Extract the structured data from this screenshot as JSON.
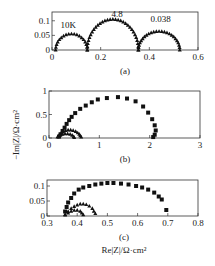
{
  "chart_data": [
    {
      "id": "a",
      "type": "scatter",
      "panel_label": "(a)",
      "xlim": [
        0,
        0.6
      ],
      "ylim": [
        0,
        0.13
      ],
      "xticks": [
        0,
        0.2,
        0.4,
        0.6
      ],
      "xtick_labels": [
        "0",
        "0.2",
        "0.4",
        "0.6"
      ],
      "yticks": [
        0,
        0.05,
        0.1
      ],
      "ytick_labels": [
        "0",
        "0.05",
        "0.1"
      ],
      "frame": {
        "x": 52,
        "y": 12,
        "w": 146,
        "h": 38
      },
      "annotations": [
        {
          "text": "10K",
          "x": 0.035,
          "y": 0.075
        },
        {
          "text": "4.8",
          "x": 0.245,
          "y": 0.113
        },
        {
          "text": "0.038",
          "x": 0.405,
          "y": 0.095
        }
      ],
      "series": [
        {
          "name": "arc1",
          "marker": "triangle",
          "center": 0.08,
          "radius": 0.065,
          "ycenter": 0.0,
          "yscale": 0.85,
          "n": 18
        },
        {
          "name": "arc2",
          "marker": "triangle",
          "center": 0.25,
          "radius": 0.105,
          "ycenter": 0.0,
          "yscale": 1.0,
          "n": 30
        },
        {
          "name": "arc3",
          "marker": "triangle",
          "center": 0.44,
          "radius": 0.085,
          "ycenter": 0.0,
          "yscale": 0.75,
          "n": 24
        }
      ]
    },
    {
      "id": "b",
      "type": "scatter",
      "panel_label": "(b)",
      "ylabel": "−Im|Z|/Ω·cm²",
      "xlim": [
        0,
        3
      ],
      "ylim": [
        0,
        1
      ],
      "xticks": [
        0,
        1,
        2,
        3
      ],
      "xtick_labels": [
        "0",
        "1",
        "2",
        "3"
      ],
      "yticks": [
        0,
        0.5,
        1
      ],
      "ytick_labels": [
        "0",
        "0.5",
        "1"
      ],
      "frame": {
        "x": 49,
        "y": 91,
        "w": 151,
        "h": 47
      },
      "series": [
        {
          "name": "squares",
          "marker": "square",
          "points": [
            [
              0.2,
              0.03
            ],
            [
              0.23,
              0.08
            ],
            [
              0.27,
              0.15
            ],
            [
              0.31,
              0.22
            ],
            [
              0.35,
              0.3
            ],
            [
              0.4,
              0.38
            ],
            [
              0.45,
              0.45
            ],
            [
              0.52,
              0.53
            ],
            [
              0.62,
              0.62
            ],
            [
              0.73,
              0.69
            ],
            [
              0.85,
              0.76
            ],
            [
              0.97,
              0.82
            ],
            [
              1.15,
              0.85
            ],
            [
              1.37,
              0.87
            ],
            [
              1.55,
              0.84
            ],
            [
              1.72,
              0.78
            ],
            [
              1.87,
              0.67
            ],
            [
              1.97,
              0.54
            ],
            [
              2.05,
              0.4
            ],
            [
              2.1,
              0.27
            ],
            [
              2.12,
              0.16
            ],
            [
              2.1,
              0.07
            ],
            [
              2.07,
              0.02
            ]
          ]
        },
        {
          "name": "triangles",
          "marker": "triangle",
          "points": [
            [
              0.17,
              0.02
            ],
            [
              0.2,
              0.06
            ],
            [
              0.24,
              0.1
            ],
            [
              0.28,
              0.13
            ],
            [
              0.33,
              0.16
            ],
            [
              0.38,
              0.17
            ],
            [
              0.43,
              0.17
            ],
            [
              0.48,
              0.16
            ],
            [
              0.53,
              0.14
            ],
            [
              0.57,
              0.11
            ],
            [
              0.6,
              0.08
            ],
            [
              0.62,
              0.05
            ],
            [
              0.64,
              0.02
            ]
          ]
        },
        {
          "name": "circles",
          "marker": "triangle",
          "points": [
            [
              0.18,
              0.03
            ],
            [
              0.22,
              0.06
            ],
            [
              0.27,
              0.08
            ],
            [
              0.32,
              0.09
            ],
            [
              0.37,
              0.09
            ],
            [
              0.42,
              0.08
            ],
            [
              0.46,
              0.06
            ],
            [
              0.49,
              0.03
            ],
            [
              0.5,
              0.01
            ]
          ]
        }
      ]
    },
    {
      "id": "c",
      "type": "scatter",
      "panel_label": "(c)",
      "xlabel": "Re|Z|/Ω·cm²",
      "xlim": [
        0.3,
        0.8
      ],
      "ylim": [
        0,
        0.12
      ],
      "xticks": [
        0.3,
        0.4,
        0.5,
        0.6,
        0.7,
        0.8
      ],
      "xtick_labels": [
        "0.3",
        "0.4",
        "0.5",
        "0.6",
        "0.7",
        "0.8"
      ],
      "yticks": [
        0,
        0.05,
        0.1
      ],
      "ytick_labels": [
        "0",
        "0.05",
        "0.1"
      ],
      "frame": {
        "x": 47,
        "y": 180,
        "w": 151,
        "h": 36
      },
      "series": [
        {
          "name": "squares",
          "marker": "square",
          "points": [
            [
              0.36,
              0.015
            ],
            [
              0.365,
              0.03
            ],
            [
              0.37,
              0.045
            ],
            [
              0.38,
              0.06
            ],
            [
              0.39,
              0.075
            ],
            [
              0.405,
              0.088
            ],
            [
              0.42,
              0.095
            ],
            [
              0.44,
              0.1
            ],
            [
              0.46,
              0.105
            ],
            [
              0.48,
              0.108
            ],
            [
              0.5,
              0.11
            ],
            [
              0.52,
              0.11
            ],
            [
              0.545,
              0.108
            ],
            [
              0.57,
              0.105
            ],
            [
              0.595,
              0.1
            ],
            [
              0.615,
              0.095
            ],
            [
              0.635,
              0.088
            ],
            [
              0.655,
              0.078
            ],
            [
              0.67,
              0.065
            ],
            [
              0.68,
              0.055
            ],
            [
              0.695,
              0.02
            ]
          ]
        },
        {
          "name": "triangles",
          "marker": "triangle",
          "points": [
            [
              0.36,
              0.005
            ],
            [
              0.37,
              0.015
            ],
            [
              0.38,
              0.025
            ],
            [
              0.39,
              0.032
            ],
            [
              0.4,
              0.037
            ],
            [
              0.41,
              0.04
            ],
            [
              0.42,
              0.04
            ],
            [
              0.43,
              0.038
            ],
            [
              0.44,
              0.033
            ],
            [
              0.45,
              0.025
            ],
            [
              0.455,
              0.016
            ],
            [
              0.46,
              0.008
            ]
          ]
        },
        {
          "name": "circles",
          "marker": "triangle",
          "points": [
            [
              0.36,
              0.003
            ],
            [
              0.37,
              0.01
            ],
            [
              0.38,
              0.016
            ],
            [
              0.39,
              0.019
            ],
            [
              0.4,
              0.019
            ],
            [
              0.41,
              0.016
            ],
            [
              0.415,
              0.01
            ],
            [
              0.42,
              0.004
            ]
          ]
        }
      ]
    }
  ],
  "labels": {
    "panel_a": "(a)",
    "panel_b": "(b)",
    "panel_c": "(c)",
    "ylabel_b": "−Im|Z|/Ω·cm²",
    "xlabel_c": "Re|Z|/Ω·cm²"
  }
}
